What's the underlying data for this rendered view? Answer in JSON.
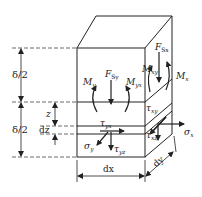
{
  "diagram": {
    "dimensions": {
      "upper_half": "δ/2",
      "lower_half": "δ/2",
      "z": "z",
      "dz": "dz",
      "dx": "dx",
      "dy": "dy"
    },
    "forces": {
      "shear_y": "F",
      "shear_y_sub": "Sy",
      "shear_x": "F",
      "shear_x_sub": "Sx"
    },
    "moments": {
      "my": "M",
      "my_sub": "y",
      "myx": "M",
      "myx_sub": "yx",
      "mxy": "M",
      "mxy_sub": "xy",
      "mx": "M",
      "mx_sub": "x"
    },
    "stresses": {
      "sigma_x": "σ",
      "sigma_x_sub": "x",
      "sigma_y": "σ",
      "sigma_y_sub": "y",
      "tau_yx": "τ",
      "tau_yx_sub": "yx",
      "tau_yz": "τ",
      "tau_yz_sub": "yz",
      "tau_xy": "τ",
      "tau_xy_sub": "xy",
      "tau_xz": "τ",
      "tau_xz_sub": "xz"
    },
    "colors": {
      "line": "#222222",
      "background": "#ffffff"
    }
  }
}
